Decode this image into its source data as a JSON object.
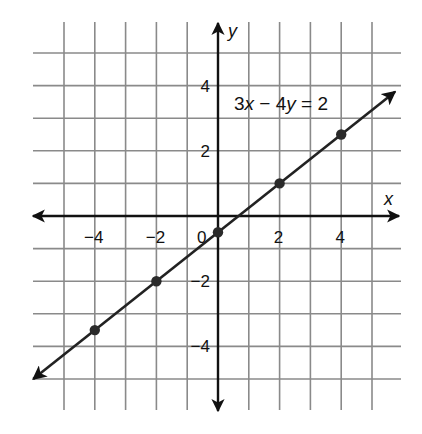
{
  "chart_data": {
    "type": "line",
    "title": "",
    "equation": "3x − 4y = 2",
    "equation_parts": [
      "3",
      "x",
      " − 4",
      "y",
      " = 2"
    ],
    "xlabel": "x",
    "ylabel": "y",
    "xlim": [
      -5,
      5
    ],
    "ylim": [
      -5,
      5
    ],
    "grid": true,
    "x_ticks": [
      -4,
      -2,
      0,
      2,
      4
    ],
    "x_tick_labels": [
      "−4",
      "−2",
      "0",
      "2",
      "4"
    ],
    "y_ticks": [
      4,
      2,
      -2,
      -4
    ],
    "y_tick_labels": [
      "4",
      "2",
      "−2",
      "−4"
    ],
    "origin_label": "0",
    "series": [
      {
        "name": "3x − 4y = 2",
        "x": [
          -4,
          -2,
          0,
          2,
          4
        ],
        "y": [
          -3.5,
          -2,
          -0.5,
          1,
          2.5
        ]
      }
    ],
    "line_extends_both_directions": true
  },
  "layout": {
    "origin_px": [
      218,
      216
    ],
    "unit_x_px": 30.8,
    "unit_y_px": 32.6,
    "grid_bounds_px": {
      "left": 33,
      "right": 401,
      "top": 22,
      "bottom": 410
    },
    "colors": {
      "grid": "#8a8a8a",
      "axis": "#111111",
      "line": "#222222",
      "background": "#ffffff"
    }
  }
}
